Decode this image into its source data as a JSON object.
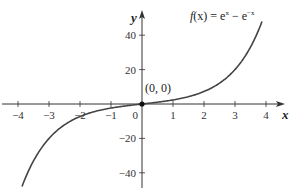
{
  "chart_data": {
    "type": "line",
    "title_parts": {
      "lhs": "f",
      "arg": "(x)",
      "eq": " = e",
      "sup1": "x",
      "minus": " − e",
      "sup2": "−x"
    },
    "xlabel": "x",
    "ylabel": "y",
    "xlim": [
      -4.3,
      4.3
    ],
    "ylim": [
      -47,
      50
    ],
    "x_ticks": [
      -4,
      -3,
      -2,
      -1,
      1,
      2,
      3,
      4
    ],
    "x_tick_labels": [
      "−4",
      "−3",
      "−2",
      "−1",
      "1",
      "2",
      "3",
      "4"
    ],
    "origin_label": "0",
    "y_ticks": [
      -40,
      -20,
      20,
      40
    ],
    "y_tick_labels": [
      "−40",
      "−20",
      "20",
      "40"
    ],
    "grid": false,
    "legend": "none",
    "curve_domain": [
      -3.87,
      3.87
    ],
    "series": [
      {
        "name": "f(x) = e^x − e^−x",
        "function": "exp(x) - exp(-x)",
        "x": [
          -3.87,
          -3.5,
          -3,
          -2.5,
          -2,
          -1.5,
          -1,
          -0.5,
          0,
          0.5,
          1,
          1.5,
          2,
          2.5,
          3,
          3.5,
          3.87
        ],
        "y": [
          -47.9,
          -33.1,
          -20.0,
          -12.1,
          -7.3,
          -4.3,
          -2.4,
          -1.0,
          0,
          1.0,
          2.4,
          4.3,
          7.3,
          12.1,
          20.0,
          33.1,
          47.9
        ]
      }
    ],
    "annotations": [
      {
        "text": "(0, 0)",
        "x": 0,
        "y": 0,
        "marker": "point"
      }
    ],
    "colors": {
      "curve": "#444444",
      "axes": "#333333",
      "point": "#111111"
    }
  }
}
